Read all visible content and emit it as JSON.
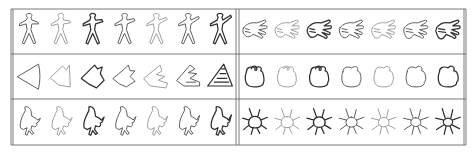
{
  "figure": {
    "colors": {
      "background": "#ffffff",
      "frame": "#6b6b6b",
      "stroke_dark": "#2e2e2e",
      "stroke_mid": "#555555",
      "stroke_light": "#9a9a9a"
    },
    "frame": {
      "left": 11,
      "right": 466,
      "top": 9,
      "bottom": 145,
      "col_divider_x": 237.5,
      "row_dividers_y": [
        54,
        99
      ]
    },
    "panels": [
      {
        "id": "human-figures",
        "row": 0,
        "col": 0,
        "shape": "human",
        "count": 7,
        "weights": [
          "mid",
          "light",
          "dark",
          "mid",
          "light",
          "mid",
          "dark"
        ]
      },
      {
        "id": "hands",
        "row": 0,
        "col": 1,
        "shape": "hand",
        "count": 7,
        "weights": [
          "mid",
          "light",
          "dark",
          "mid",
          "light",
          "mid",
          "dark"
        ]
      },
      {
        "id": "triangles-to-spiral",
        "row": 1,
        "col": 0,
        "shape": "triangle",
        "count": 7,
        "weights": [
          "mid",
          "light",
          "dark",
          "mid",
          "light",
          "mid",
          "dark"
        ]
      },
      {
        "id": "blobs",
        "row": 1,
        "col": 1,
        "shape": "blob",
        "count": 7,
        "weights": [
          "dark",
          "light",
          "dark",
          "mid",
          "light",
          "mid",
          "dark"
        ]
      },
      {
        "id": "birds",
        "row": 2,
        "col": 0,
        "shape": "bird",
        "count": 7,
        "weights": [
          "mid",
          "light",
          "dark",
          "mid",
          "light",
          "mid",
          "dark"
        ]
      },
      {
        "id": "insects",
        "row": 2,
        "col": 1,
        "shape": "insect",
        "count": 7,
        "weights": [
          "dark",
          "light",
          "dark",
          "mid",
          "light",
          "mid",
          "dark"
        ]
      }
    ]
  }
}
